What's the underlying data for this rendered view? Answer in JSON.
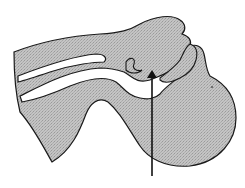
{
  "figure": {
    "type": "anatomical-cross-section",
    "fill_color": "#bdbdbd",
    "outline_color": "#1a1a1a",
    "cavity_color": "#ffffff",
    "arrow": {
      "direction": "up",
      "color": "#111111"
    }
  }
}
